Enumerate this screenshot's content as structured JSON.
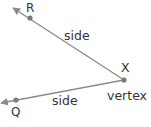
{
  "diagram": {
    "type": "angle",
    "colors": {
      "line": "#8a8a8a",
      "point": "#7a7a7a",
      "text": "#333333"
    },
    "vertex": {
      "name": "X",
      "label": "vertex",
      "x": 124,
      "y": 80
    },
    "points": [
      {
        "name": "R",
        "x": 30,
        "y": 18
      },
      {
        "name": "Q",
        "x": 16,
        "y": 100
      }
    ],
    "sides": [
      {
        "from": "X",
        "through": "R",
        "label": "side"
      },
      {
        "from": "X",
        "through": "Q",
        "label": "side"
      }
    ]
  }
}
